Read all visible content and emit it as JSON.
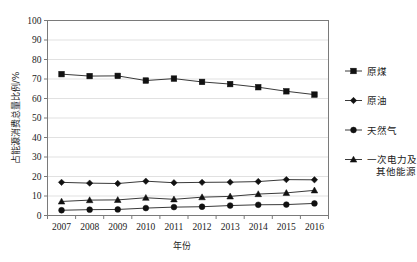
{
  "chart_data": {
    "type": "line",
    "title": "",
    "xlabel": "年份",
    "ylabel": "占能源消费总量比例/%",
    "categories": [
      "2007",
      "2008",
      "2009",
      "2010",
      "2011",
      "2012",
      "2013",
      "2014",
      "2015",
      "2016"
    ],
    "x": [
      2007,
      2008,
      2009,
      2010,
      2011,
      2012,
      2013,
      2014,
      2015,
      2016
    ],
    "ylim": [
      0,
      100
    ],
    "yticks": [
      0,
      10,
      20,
      30,
      40,
      50,
      60,
      70,
      80,
      90,
      100
    ],
    "grid": true,
    "legend_position": "right",
    "series": [
      {
        "name": "原煤",
        "marker": "square",
        "color": "#111111",
        "values": [
          72.5,
          71.5,
          71.6,
          69.2,
          70.2,
          68.5,
          67.4,
          65.8,
          63.7,
          62.0
        ]
      },
      {
        "name": "原油",
        "marker": "diamond",
        "color": "#111111",
        "values": [
          17.0,
          16.6,
          16.4,
          17.6,
          16.8,
          17.0,
          17.1,
          17.4,
          18.4,
          18.3
        ]
      },
      {
        "name": "天然气",
        "marker": "circle",
        "color": "#111111",
        "values": [
          2.7,
          3.0,
          3.1,
          3.8,
          4.3,
          4.5,
          5.1,
          5.5,
          5.6,
          6.2
        ]
      },
      {
        "name": "一次电力及其他能源",
        "marker": "triangle",
        "color": "#111111",
        "values": [
          7.2,
          7.9,
          8.0,
          9.1,
          8.3,
          9.4,
          9.8,
          11.0,
          11.6,
          12.9
        ]
      }
    ],
    "legend_entries": [
      {
        "label": "原煤",
        "marker": "square"
      },
      {
        "label": "原油",
        "marker": "diamond"
      },
      {
        "label": "天然气",
        "marker": "circle"
      },
      {
        "label": "一次电力及",
        "label2": "其他能源",
        "marker": "triangle"
      }
    ]
  }
}
